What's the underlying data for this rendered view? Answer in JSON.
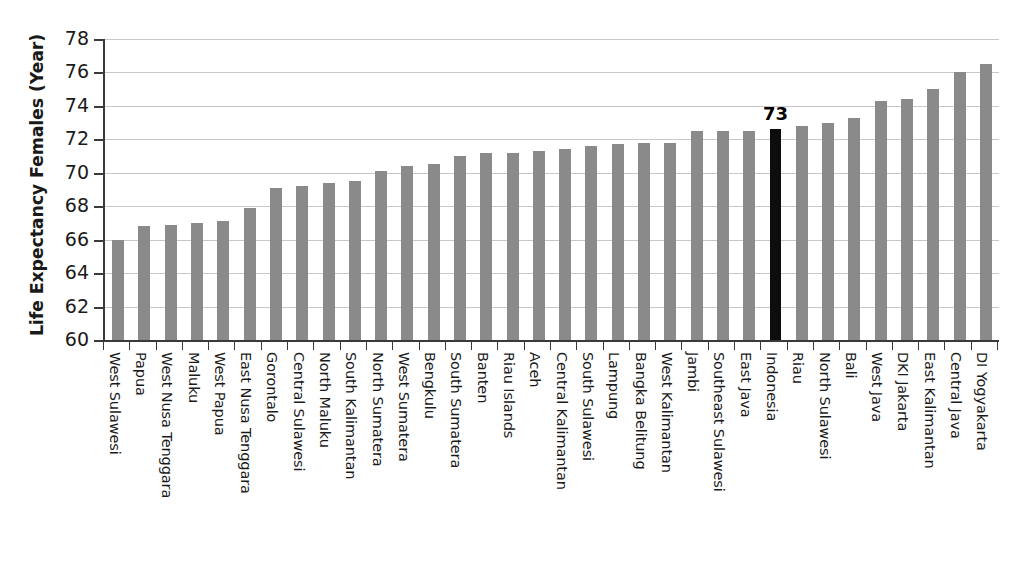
{
  "chart_data": {
    "type": "bar",
    "title": "",
    "subtitle": "",
    "xlabel": "",
    "ylabel": "Life Expectancy Females (Year)",
    "ylim": [
      60,
      78
    ],
    "ytick_step": 2,
    "yticks": [
      78,
      76,
      74,
      72,
      70,
      68,
      66,
      64,
      62,
      60
    ],
    "grid": "horizontal",
    "legend": "none",
    "bar_color": "#8a8a8a",
    "highlight_color": "#0d0d0d",
    "highlight_category": "Indonesia",
    "annotations": [
      {
        "category": "Indonesia",
        "text": "73"
      }
    ],
    "categories": [
      "West Sulawesi",
      "Papua",
      "West Nusa Tenggara",
      "Maluku",
      "West Papua",
      "East Nusa Tenggara",
      "Gorontalo",
      "Central Sulawesi",
      "North Maluku",
      "South Kalimantan",
      "North Sumatera",
      "West Sumatera",
      "Bengkulu",
      "South Sumatera",
      "Banten",
      "Riau Islands",
      "Aceh",
      "Central Kalimantan",
      "South Sulawesi",
      "Lampung",
      "Bangka Belitung",
      "West Kalimantan",
      "Jambi",
      "Southeast Sulawesi",
      "East Java",
      "Indonesia",
      "Riau",
      "North Sulawesi",
      "Bali",
      "West Java",
      "DKI Jakarta",
      "East Kalimantan",
      "Central Java",
      "DI Yogyakarta"
    ],
    "values": [
      66.0,
      66.8,
      66.9,
      67.0,
      67.1,
      67.9,
      69.1,
      69.2,
      69.4,
      69.5,
      70.1,
      70.4,
      70.5,
      71.0,
      71.2,
      71.2,
      71.3,
      71.4,
      71.6,
      71.7,
      71.8,
      71.8,
      72.5,
      72.5,
      72.5,
      72.6,
      72.8,
      73.0,
      73.3,
      74.3,
      74.4,
      75.0,
      76.0,
      76.5
    ]
  }
}
